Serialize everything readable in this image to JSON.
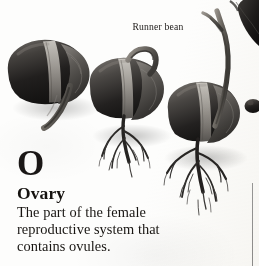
{
  "page": {
    "background_color": "#fdfdfc",
    "ink_color": "#181512"
  },
  "illustration": {
    "caption": "Runner bean",
    "subject": "germinating runner bean seeds",
    "stage_count": 3,
    "stages": [
      {
        "name": "stage-1-seed-with-emerging-radicle",
        "description": "dark bean seed with pale hilum band and a curved radicle emerging downward"
      },
      {
        "name": "stage-2-seedling-with-primary-roots",
        "description": "bean seed with branching fibrous root system and a small shoot hook above"
      },
      {
        "name": "stage-3-seedling-with-shoot-and-root-network",
        "description": "bean seed with long curving shoot rising upward and an extensive branching root network"
      }
    ],
    "edge_elements": [
      {
        "name": "cropped-leaf-top-right",
        "tone": "dark"
      },
      {
        "name": "cropped-seed-right-edge",
        "tone": "dark"
      }
    ]
  },
  "entry": {
    "drop_cap": "O",
    "term": "Ovary",
    "definition_lines": [
      "The part of the female",
      "reproductive system that",
      "contains ovules."
    ]
  },
  "divider": {
    "name": "column-rule",
    "orientation": "vertical",
    "color": "#949494"
  }
}
